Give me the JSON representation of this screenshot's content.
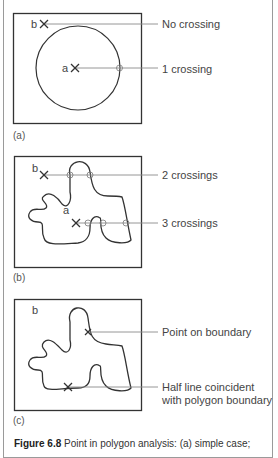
{
  "figure": {
    "panels": [
      {
        "id": "a",
        "panel_label": "(a)",
        "point_labels": {
          "b": "b",
          "a": "a"
        },
        "annotations": [
          "No crossing",
          "1 crossing"
        ]
      },
      {
        "id": "b",
        "panel_label": "(b)",
        "point_labels": {
          "b": "b",
          "a": "a"
        },
        "annotations": [
          "2 crossings",
          "3 crossings"
        ]
      },
      {
        "id": "c",
        "panel_label": "(c)",
        "point_labels": {
          "b": "b"
        },
        "annotations": [
          "Point on boundary",
          "Half line coincident",
          "with polygon boundary"
        ]
      }
    ],
    "caption": {
      "prefix": "Figure 6.8",
      "text": " Point in polygon analysis: (a) simple case;"
    }
  },
  "colors": {
    "line": "#333333",
    "ray": "#8a8a8a",
    "frame": "#9a9a9a",
    "text": "#444444"
  }
}
